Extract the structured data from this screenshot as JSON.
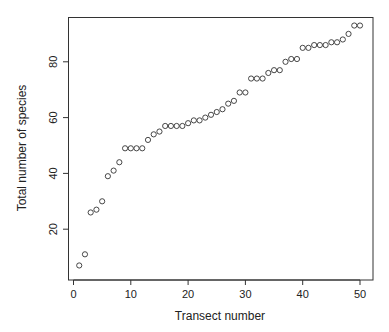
{
  "chart_data": {
    "type": "scatter",
    "title": "",
    "xlabel": "Transect number",
    "ylabel": "Total number of species",
    "xlim": [
      -1,
      52
    ],
    "ylim": [
      4,
      96
    ],
    "xticks": [
      0,
      10,
      20,
      30,
      40,
      50
    ],
    "yticks": [
      20,
      40,
      60,
      80
    ],
    "grid": false,
    "legend": null,
    "marker": "open-circle",
    "x": [
      1,
      2,
      3,
      4,
      5,
      6,
      7,
      8,
      9,
      10,
      11,
      12,
      13,
      14,
      15,
      16,
      17,
      18,
      19,
      20,
      21,
      22,
      23,
      24,
      25,
      26,
      27,
      28,
      29,
      30,
      31,
      32,
      33,
      34,
      35,
      36,
      37,
      38,
      39,
      40,
      41,
      42,
      43,
      44,
      45,
      46,
      47,
      48,
      49,
      50
    ],
    "y": [
      7,
      11,
      26,
      27,
      30,
      39,
      41,
      44,
      49,
      49,
      49,
      49,
      52,
      54,
      55,
      57,
      57,
      57,
      57,
      58,
      59,
      59,
      60,
      61,
      62,
      63,
      65,
      66,
      69,
      69,
      74,
      74,
      74,
      76,
      77,
      77,
      80,
      81,
      81,
      85,
      85,
      86,
      86,
      86,
      87,
      87,
      88,
      90,
      93,
      93
    ]
  },
  "colors": {
    "axis": "#333333",
    "marker": "#333333",
    "background": "#ffffff"
  }
}
